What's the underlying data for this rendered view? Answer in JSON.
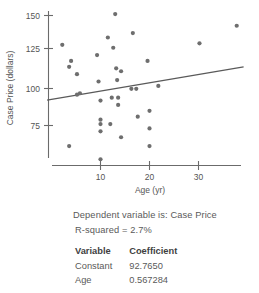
{
  "chart_data": {
    "type": "scatter",
    "title": "",
    "xlabel": "Age (yr)",
    "ylabel": "Case Price (dollars)",
    "xticks": [
      10,
      20,
      30
    ],
    "yticks": [
      75,
      100,
      125,
      150
    ],
    "xlim": [
      0,
      39
    ],
    "ylim": [
      48,
      156
    ],
    "grid": false,
    "legend": null,
    "points": [
      {
        "x": 2.2,
        "y": 130
      },
      {
        "x": 3.6,
        "y": 115
      },
      {
        "x": 4.0,
        "y": 119
      },
      {
        "x": 3.6,
        "y": 61
      },
      {
        "x": 5.2,
        "y": 110
      },
      {
        "x": 5.2,
        "y": 96
      },
      {
        "x": 5.8,
        "y": 97
      },
      {
        "x": 9.3,
        "y": 123
      },
      {
        "x": 9.6,
        "y": 105
      },
      {
        "x": 10.0,
        "y": 92
      },
      {
        "x": 10.0,
        "y": 79
      },
      {
        "x": 10.0,
        "y": 76
      },
      {
        "x": 10.0,
        "y": 71
      },
      {
        "x": 10.0,
        "y": 52
      },
      {
        "x": 11.5,
        "y": 135
      },
      {
        "x": 12.0,
        "y": 76
      },
      {
        "x": 12.3,
        "y": 94
      },
      {
        "x": 12.6,
        "y": 128
      },
      {
        "x": 13.0,
        "y": 151
      },
      {
        "x": 13.2,
        "y": 114
      },
      {
        "x": 13.4,
        "y": 106
      },
      {
        "x": 13.6,
        "y": 94
      },
      {
        "x": 13.6,
        "y": 89
      },
      {
        "x": 14.2,
        "y": 112
      },
      {
        "x": 14.2,
        "y": 67
      },
      {
        "x": 16.3,
        "y": 100
      },
      {
        "x": 16.6,
        "y": 138
      },
      {
        "x": 17.3,
        "y": 100
      },
      {
        "x": 17.6,
        "y": 81
      },
      {
        "x": 19.6,
        "y": 119
      },
      {
        "x": 20.0,
        "y": 85
      },
      {
        "x": 20.0,
        "y": 73
      },
      {
        "x": 20.0,
        "y": 61
      },
      {
        "x": 21.8,
        "y": 102
      },
      {
        "x": 30.2,
        "y": 131
      },
      {
        "x": 37.8,
        "y": 143
      }
    ],
    "trend_line": {
      "intercept": 92.765,
      "slope": 0.567284,
      "x_start": -0.9,
      "x_end": 39.2
    }
  },
  "readout": {
    "dependent_line": "Dependent variable is: Case Price",
    "rsquared_line": "R-squared = 2.7%",
    "table": {
      "headers": [
        "Variable",
        "Coefficient"
      ],
      "rows": [
        {
          "variable": "Constant",
          "coefficient": "92.7650"
        },
        {
          "variable": "Age",
          "coefficient": "0.567284"
        }
      ]
    }
  },
  "colors": {
    "point": "#6e6e6e",
    "axis": "#6b6b6b",
    "trend": "#5a5a5a",
    "text": "#5a5a5a"
  }
}
